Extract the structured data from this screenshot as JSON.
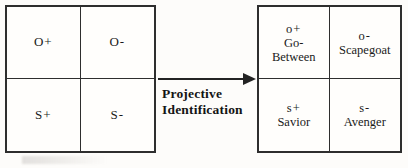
{
  "diagram": {
    "title_caption": {
      "line1": "Projective",
      "line2": "Identification"
    },
    "arrow": {
      "direction": "right",
      "name": "transformation-arrow"
    },
    "left_matrix": {
      "name": "object-self-valence-matrix",
      "cells": [
        {
          "code": "O+",
          "label": ""
        },
        {
          "code": "O-",
          "label": ""
        },
        {
          "code": "S+",
          "label": ""
        },
        {
          "code": "S-",
          "label": ""
        }
      ]
    },
    "right_matrix": {
      "name": "projective-role-matrix",
      "cells": [
        {
          "code": "o+",
          "label_line1": "Go-",
          "label_line2": "Between"
        },
        {
          "code": "o-",
          "label_line1": "Scapegoat",
          "label_line2": ""
        },
        {
          "code": "s+",
          "label_line1": "Savior",
          "label_line2": ""
        },
        {
          "code": "s-",
          "label_line1": "Avenger",
          "label_line2": ""
        }
      ]
    },
    "colors": {
      "ink": "#2e2e2e",
      "paper": "#fdfcfa"
    }
  }
}
